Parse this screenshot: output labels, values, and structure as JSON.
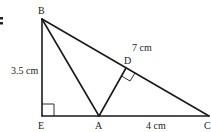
{
  "figure": {
    "marker": ":",
    "points": {
      "B": {
        "label": "B"
      },
      "E": {
        "label": "E"
      },
      "A": {
        "label": "A"
      },
      "C": {
        "label": "C"
      },
      "D": {
        "label": "D"
      }
    },
    "measurements": {
      "BE": "3.5 cm",
      "BC": "7 cm",
      "AC": "4 cm"
    },
    "right_angles": [
      "E",
      "D"
    ]
  }
}
